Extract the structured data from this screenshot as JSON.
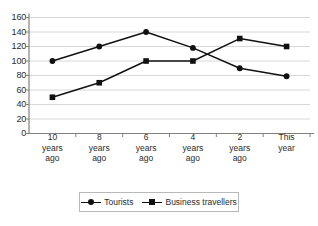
{
  "chart_data": {
    "type": "line",
    "title": "",
    "subtitle": "",
    "xlabel": "",
    "ylabel": "",
    "ylim": [
      0,
      160
    ],
    "ytick_step": 20,
    "yticks": [
      0,
      20,
      40,
      60,
      80,
      100,
      120,
      140,
      160
    ],
    "grid": true,
    "grid_axis": "y",
    "legend_position": "bottom",
    "categories": [
      "10 years ago",
      "8 years ago",
      "6 years ago",
      "4 years ago",
      "2 years ago",
      "This year"
    ],
    "category_lines": [
      [
        "10",
        "years",
        "ago"
      ],
      [
        "8",
        "years",
        "ago"
      ],
      [
        "6",
        "years",
        "ago"
      ],
      [
        "4",
        "years",
        "ago"
      ],
      [
        "2",
        "years",
        "ago"
      ],
      [
        "This",
        "year"
      ]
    ],
    "series": [
      {
        "name": "Tourists",
        "marker": "circle",
        "color": "#111111",
        "values": [
          100,
          120,
          140,
          118,
          90,
          79
        ]
      },
      {
        "name": "Business travellers",
        "marker": "square",
        "color": "#111111",
        "values": [
          50,
          70,
          100,
          100,
          131,
          120
        ]
      }
    ]
  },
  "axis": {
    "y_labels": [
      "160",
      "140",
      "120",
      "100",
      "80",
      "60",
      "40",
      "20",
      "0"
    ]
  },
  "legend": {
    "entries": [
      {
        "label": "Tourists",
        "marker": "circle"
      },
      {
        "label": "Business travellers",
        "marker": "square"
      }
    ]
  },
  "colors": {
    "background": "#ffffff",
    "gridline": "#d8d8d8",
    "axis": "#808080",
    "series": "#111111",
    "text": "#2b2b2b",
    "legend_border": "#b9b9b9"
  }
}
